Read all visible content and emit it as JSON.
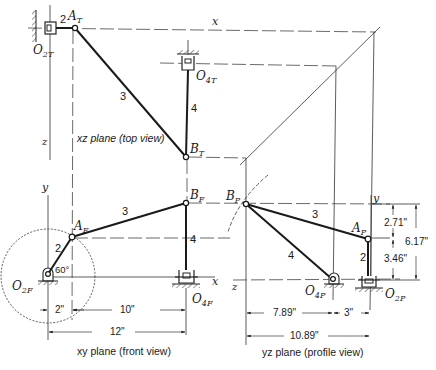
{
  "figure": {
    "views": {
      "top": {
        "caption": "xz plane (top view)",
        "axis_x": "x",
        "axis_z": "z",
        "labels": {
          "O2": "O",
          "O2_sub": "2T",
          "A": "A",
          "A_sub": "T",
          "B": "B",
          "B_sub": "T",
          "O4": "O",
          "O4_sub": "4T"
        },
        "links": {
          "link2": "2",
          "link3": "3",
          "link4": "4"
        }
      },
      "front": {
        "caption": "xy plane (front view)",
        "axis_x": "x",
        "axis_y": "y",
        "labels": {
          "O2": "O",
          "O2_sub": "2F",
          "A": "A",
          "A_sub": "F",
          "B": "B",
          "B_sub": "F",
          "O4": "O",
          "O4_sub": "4F"
        },
        "links": {
          "link2": "2",
          "link3": "3",
          "link4": "4"
        },
        "angle": "60°",
        "dimensions": {
          "d1": "2\"",
          "d2": "10\"",
          "d3": "12\""
        }
      },
      "profile": {
        "caption": "yz plane (profile view)",
        "axis_y": "y",
        "axis_z": "z",
        "labels": {
          "O2": "O",
          "O2_sub": "2P",
          "A": "A",
          "A_sub": "P",
          "B": "B",
          "B_sub": "P",
          "O4": "O",
          "O4_sub": "4P"
        },
        "links": {
          "link2": "2",
          "link3": "3",
          "link4": "4"
        },
        "dimensions": {
          "h1": "2.71\"",
          "h2": "3.46\"",
          "h_total": "6.17\"",
          "w1": "7.89\"",
          "w2": "3\"",
          "w_total": "10.89\""
        }
      }
    }
  }
}
